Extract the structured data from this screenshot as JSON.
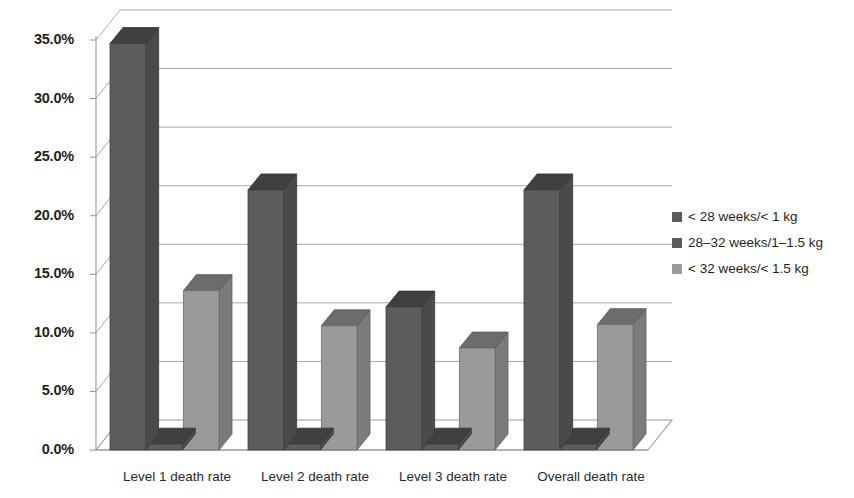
{
  "chart_data": {
    "type": "bar",
    "title": "",
    "subtitle": "",
    "xlabel": "",
    "ylabel": "",
    "categories": [
      "Level 1 death rate",
      "Level 2 death rate",
      "Level 3 death rate",
      "Overall death rate"
    ],
    "series": [
      {
        "name": "< 28 weeks/< 1 kg",
        "color": "#5c5c5c",
        "values": [
          34.7,
          22.2,
          12.2,
          22.2
        ]
      },
      {
        "name": "28–32 weeks/1–1.5 kg",
        "color": "#5c5c5c",
        "values": [
          0.5,
          0.5,
          0.5,
          0.5
        ]
      },
      {
        "name": "< 32 weeks/< 1.5 kg",
        "color": "#9a9a9a",
        "values": [
          13.6,
          10.6,
          8.7,
          10.7
        ]
      }
    ],
    "ylim": [
      0,
      35
    ],
    "ytick_labels": [
      "0.0%",
      "5.0%",
      "10.0%",
      "15.0%",
      "20.0%",
      "25.0%",
      "30.0%",
      "35.0%"
    ],
    "ytick_values": [
      0,
      5,
      10,
      15,
      20,
      25,
      30,
      35
    ],
    "grid": true,
    "gridline_color": "#a8a8a8",
    "legend_position": "right",
    "style": "3d-perspective-column",
    "background": "#ffffff"
  },
  "legend": {
    "items": [
      {
        "label": "< 28 weeks/< 1 kg",
        "color": "#5c5c5c"
      },
      {
        "label": "28–32 weeks/1–1.5 kg",
        "color": "#5c5c5c"
      },
      {
        "label": "< 32 weeks/< 1.5 kg",
        "color": "#9a9a9a"
      }
    ]
  }
}
